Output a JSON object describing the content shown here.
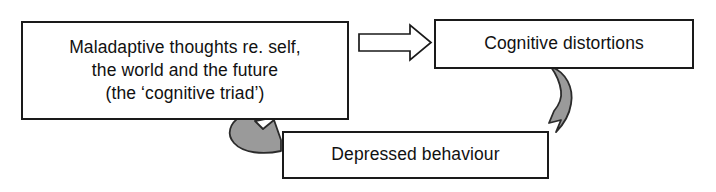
{
  "diagram": {
    "background_color": "#ffffff",
    "nodes": [
      {
        "id": "cognitive-triad",
        "label": "Maladaptive thoughts re. self,\nthe world and the future\n(the ‘cognitive triad’)",
        "shape": "rectangle",
        "fill": "#ffffff",
        "stroke": "#1a1a1a"
      },
      {
        "id": "cognitive-distortions",
        "label": "Cognitive distortions",
        "shape": "rectangle",
        "fill": "#ffffff",
        "stroke": "#1a1a1a"
      },
      {
        "id": "depressed-behaviour",
        "label": "Depressed behaviour",
        "shape": "rectangle",
        "fill": "#ffffff",
        "stroke": "#1a1a1a"
      }
    ],
    "edges": [
      {
        "id": "triad-to-distortions",
        "from": "cognitive-triad",
        "to": "cognitive-distortions",
        "style": "hollow-block-arrow",
        "direction": "right",
        "fill": "#ffffff",
        "stroke": "#1a1a1a"
      },
      {
        "id": "distortions-to-behaviour",
        "from": "cognitive-distortions",
        "to": "depressed-behaviour",
        "style": "curved-ribbon-arrow",
        "direction": "down",
        "fill": "#9a9a9a",
        "stroke": "#2b2b2b"
      },
      {
        "id": "behaviour-to-triad",
        "from": "depressed-behaviour",
        "to": "cognitive-triad",
        "style": "curved-ribbon-arrow",
        "direction": "up-right",
        "fill": "#9a9a9a",
        "stroke": "#2b2b2b"
      }
    ]
  }
}
